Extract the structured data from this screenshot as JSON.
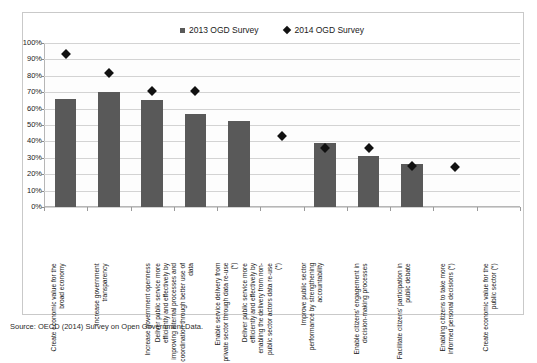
{
  "legend": {
    "position": "top-center",
    "entries": [
      {
        "label": "2013 OGD Survey",
        "marker": "square-marker-icon",
        "color": "#595959"
      },
      {
        "label": "2014 OGD Survey",
        "marker": "diamond-marker-icon",
        "color": "#111111"
      }
    ]
  },
  "source_note": "Source: OECD (2014) Survey on Open Government Data.",
  "chart_data": {
    "type": "bar",
    "title": "",
    "subtitle": "",
    "xlabel": "",
    "ylabel": "",
    "ylim": [
      0,
      100
    ],
    "yticks": [
      "0%",
      "10%",
      "20%",
      "30%",
      "40%",
      "50%",
      "60%",
      "70%",
      "80%",
      "90%",
      "100%"
    ],
    "ytick_values": [
      0,
      10,
      20,
      30,
      40,
      50,
      60,
      70,
      80,
      90,
      100
    ],
    "grid": true,
    "legend_position": "top-center",
    "categories": [
      "Create economic value for the broad economy",
      "Increase government transparency",
      "Increase government openness",
      "Deliver public service more efficiently and effectively by improving internal processes and coordination through better use of data",
      "Enable service delivery from private sector through data re-use (*)",
      "Deliver public service more efficiently and effectively by enabling the delivery from non-public sector actors data re-use (*)",
      "Improve public sector performance by strengthening accountability",
      "Enable citizens' engagement in decision-making processes",
      "Facilitate citizens' participation in public debate",
      "Enabling citizens to take more informed personal decisions (*)",
      "Create economic value for the public sector (*)"
    ],
    "series": [
      {
        "name": "2013 OGD Survey",
        "type": "bar",
        "color": "#595959",
        "values": [
          66,
          70,
          65,
          57,
          52.5,
          null,
          39,
          31,
          26,
          null,
          null
        ]
      },
      {
        "name": "2014 OGD Survey",
        "type": "scatter",
        "color": "#111111",
        "values": [
          93,
          82,
          71,
          71,
          null,
          43,
          36,
          36,
          25,
          24.5,
          null
        ]
      }
    ]
  }
}
